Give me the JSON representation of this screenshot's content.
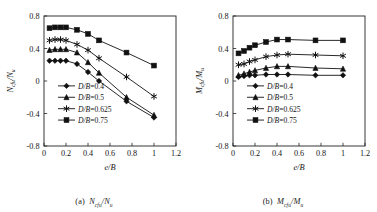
{
  "figure": {
    "panels": [
      {
        "id": "a",
        "caption_prefix": "(a)",
        "caption_numerator": "N",
        "caption_num_sub": "cfu",
        "caption_denominator": "N",
        "caption_den_sub": "u"
      },
      {
        "id": "b",
        "caption_prefix": "(b)",
        "caption_numerator": "M",
        "caption_num_sub": "cfu",
        "caption_denominator": "M",
        "caption_den_sub": "u"
      }
    ]
  },
  "chart_data": [
    {
      "type": "line",
      "panel": "(a)",
      "title": "(a) Ncfu/Nu",
      "xlabel": "e/B",
      "ylabel": "Ncfu/Nu",
      "ylabel_parts": {
        "numerator": "N",
        "num_sub": "cfu",
        "denominator": "N",
        "den_sub": "u"
      },
      "xlabel_parts": {
        "numerator": "e",
        "denominator": "B"
      },
      "xlim": [
        0,
        1.2
      ],
      "ylim": [
        -0.8,
        0.8
      ],
      "xticks": [
        0,
        0.2,
        0.4,
        0.6,
        0.8,
        1,
        1.2
      ],
      "xtick_labels": [
        "0",
        "0.2",
        "0.4",
        "0.6",
        "0.8",
        "1",
        "1.2"
      ],
      "yticks": [
        -0.8,
        -0.4,
        0,
        0.4,
        0.8
      ],
      "ytick_labels": [
        "-0.8",
        "-0.4",
        "0",
        "0.4",
        "0.8"
      ],
      "grid": false,
      "legend_position": "center-left",
      "x": [
        0.05,
        0.1,
        0.15,
        0.2,
        0.3,
        0.4,
        0.5,
        0.75,
        1.0
      ],
      "series": [
        {
          "name": "D/B=0.4",
          "marker": "diamond",
          "values": [
            0.25,
            0.25,
            0.25,
            0.25,
            0.21,
            0.11,
            0.0,
            -0.25,
            -0.45
          ]
        },
        {
          "name": "D/B=0.5",
          "marker": "triangle",
          "values": [
            0.38,
            0.39,
            0.39,
            0.39,
            0.35,
            0.23,
            0.1,
            -0.2,
            -0.42
          ]
        },
        {
          "name": "D/B=0.625",
          "marker": "star",
          "values": [
            0.5,
            0.51,
            0.51,
            0.5,
            0.45,
            0.38,
            0.28,
            0.05,
            -0.19
          ]
        },
        {
          "name": "D/B=0.75",
          "marker": "square",
          "values": [
            0.65,
            0.66,
            0.66,
            0.66,
            0.63,
            0.58,
            0.5,
            0.35,
            0.19
          ]
        }
      ]
    },
    {
      "type": "line",
      "panel": "(b)",
      "title": "(b) Mcfu/Mu",
      "xlabel": "e/B",
      "ylabel": "Mcfu/Mu",
      "ylabel_parts": {
        "numerator": "M",
        "num_sub": "cfu",
        "denominator": "M",
        "den_sub": "u"
      },
      "xlabel_parts": {
        "numerator": "e",
        "denominator": "B"
      },
      "xlim": [
        0,
        1.2
      ],
      "ylim": [
        -0.8,
        0.8
      ],
      "xticks": [
        0,
        0.2,
        0.4,
        0.6,
        0.8,
        1,
        1.2
      ],
      "xtick_labels": [
        "0",
        "0.2",
        "0.4",
        "0.6",
        "0.8",
        "1",
        "1.2"
      ],
      "yticks": [
        -0.8,
        -0.4,
        0,
        0.4,
        0.8
      ],
      "ytick_labels": [
        "-0.8",
        "-0.4",
        "0",
        "0.4",
        "0.8"
      ],
      "grid": false,
      "legend_position": "center-left",
      "x": [
        0.05,
        0.1,
        0.15,
        0.2,
        0.3,
        0.4,
        0.5,
        0.75,
        1.0
      ],
      "series": [
        {
          "name": "D/B=0.4",
          "marker": "diamond",
          "values": [
            0.05,
            0.06,
            0.07,
            0.07,
            0.08,
            0.08,
            0.08,
            0.07,
            0.07
          ]
        },
        {
          "name": "D/B=0.5",
          "marker": "triangle",
          "values": [
            0.07,
            0.09,
            0.11,
            0.13,
            0.16,
            0.18,
            0.18,
            0.16,
            0.15
          ]
        },
        {
          "name": "D/B=0.625",
          "marker": "star",
          "values": [
            0.2,
            0.21,
            0.24,
            0.26,
            0.3,
            0.32,
            0.33,
            0.32,
            0.31
          ]
        },
        {
          "name": "D/B=0.75",
          "marker": "square",
          "values": [
            0.34,
            0.37,
            0.41,
            0.44,
            0.48,
            0.51,
            0.51,
            0.5,
            0.5
          ]
        }
      ],
      "legend": [
        "D/B=0.4",
        "D/B=0.5",
        "D/B=0.625",
        "D/B=0.75"
      ]
    }
  ]
}
